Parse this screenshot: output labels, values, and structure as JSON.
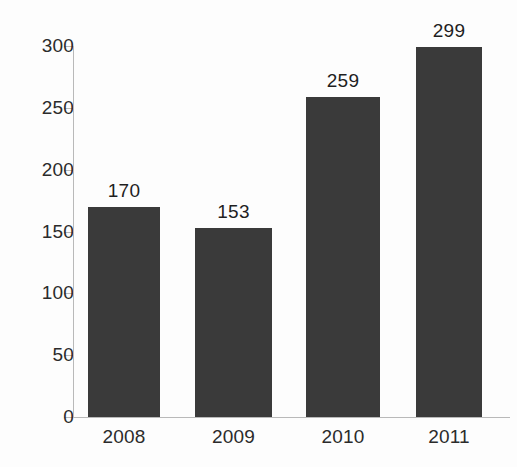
{
  "chart_data": {
    "type": "bar",
    "title": "",
    "subtitle": "",
    "xlabel": "",
    "ylabel": "",
    "categories": [
      "2008",
      "2009",
      "2010",
      "2011"
    ],
    "values": [
      170,
      153,
      259,
      299
    ],
    "data_labels": [
      "170",
      "153",
      "259",
      "299"
    ],
    "ylim": [
      0,
      300
    ],
    "y_ticks": [
      0,
      50,
      100,
      150,
      200,
      250,
      300
    ],
    "y_tick_labels": [
      "0",
      "50",
      "100",
      "150",
      "200",
      "250",
      "300"
    ],
    "grid": false,
    "legend": null,
    "legend_position": "none",
    "bar_color": "#3a3a3a",
    "axis_color": "#b9b9b9",
    "text_color": "#2b2b2b",
    "background_color": "#fdfdfd",
    "series": [
      {
        "name": "",
        "values": [
          170,
          153,
          259,
          299
        ]
      }
    ]
  }
}
